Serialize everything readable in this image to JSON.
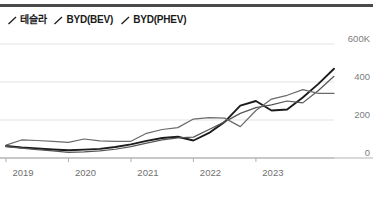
{
  "header": {
    "divider": "top-rule"
  },
  "legend": {
    "position": "top-left",
    "marker_shape": "diagonal-slash",
    "items": [
      {
        "label": "테슬라",
        "color": "#1c1c1c",
        "marker": "slash-icon"
      },
      {
        "label": "BYD(BEV)",
        "color": "#555555",
        "marker": "slash-icon"
      },
      {
        "label": "BYD(PHEV)",
        "color": "#555555",
        "marker": "slash-icon"
      }
    ]
  },
  "chart_data": {
    "type": "line",
    "title": "",
    "subtitle": "",
    "xlabel": "",
    "ylabel": "",
    "grid": true,
    "legend_position": "top-left",
    "ylim": [
      0,
      600
    ],
    "yticks": [
      0,
      200,
      400,
      600
    ],
    "ytick_labels": [
      "0",
      "200",
      "400",
      "600K"
    ],
    "unit": "K",
    "xlim": [
      2019.0,
      2024.25
    ],
    "xticks": [
      2019,
      2020,
      2021,
      2022,
      2023
    ],
    "xtick_labels": [
      "2019",
      "2020",
      "2021",
      "2022",
      "2023"
    ],
    "x": [
      2019.0,
      2019.25,
      2019.5,
      2019.75,
      2020.0,
      2020.25,
      2020.5,
      2020.75,
      2021.0,
      2021.25,
      2021.5,
      2021.75,
      2022.0,
      2022.25,
      2022.5,
      2022.75,
      2023.0,
      2023.25,
      2023.5,
      2023.75,
      2024.0,
      2024.25
    ],
    "series": [
      {
        "name": "테슬라",
        "color": "#1c1c1c",
        "width": 1.9,
        "values": [
          63,
          55,
          50,
          45,
          41,
          44,
          48,
          58,
          72,
          90,
          105,
          112,
          92,
          132,
          190,
          276,
          300,
          250,
          255,
          318,
          390,
          470
        ]
      },
      {
        "name": "BYD(BEV)",
        "color": "#555555",
        "width": 1.2,
        "values": [
          60,
          52,
          44,
          38,
          30,
          32,
          37,
          46,
          60,
          78,
          95,
          106,
          110,
          150,
          190,
          235,
          265,
          280,
          300,
          290,
          355,
          430
        ]
      },
      {
        "name": "BYD(PHEV)",
        "color": "#6a6a6a",
        "width": 1.2,
        "values": [
          68,
          95,
          92,
          88,
          82,
          100,
          90,
          88,
          88,
          130,
          150,
          160,
          205,
          212,
          210,
          165,
          250,
          310,
          330,
          360,
          340,
          340
        ]
      }
    ]
  },
  "axes": {
    "baseline_color": "#b5b5b5",
    "gridline_color": "#e3e3e3",
    "tick_color": "#b0b0b0"
  }
}
